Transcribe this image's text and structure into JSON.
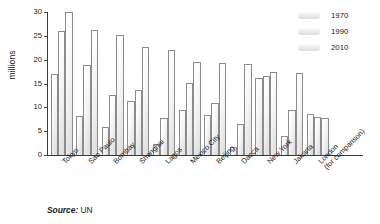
{
  "chart_data": {
    "type": "bar",
    "title": "",
    "xlabel": "",
    "ylabel": "millions",
    "ylim": [
      0,
      30
    ],
    "yticks": [
      0,
      5,
      10,
      15,
      20,
      25,
      30
    ],
    "grid": false,
    "legend_position": "top-right",
    "categories": [
      "Tokyo",
      "Sao Paulo",
      "Bombay",
      "Shanghai",
      "Lagos",
      "Mexico City",
      "Beijing",
      "Dacca",
      "New York",
      "Jakarta",
      "London"
    ],
    "category_sublabels": [
      "",
      "",
      "",
      "",
      "",
      "",
      "",
      "",
      "",
      "",
      "(for comparison)"
    ],
    "series": [
      {
        "name": "1970",
        "values": [
          17.0,
          8.1,
          5.8,
          11.4,
          2.3,
          9.5,
          8.4,
          1.7,
          16.2,
          4.0,
          8.6
        ]
      },
      {
        "name": "1990",
        "values": [
          26.0,
          18.8,
          12.6,
          13.6,
          7.7,
          15.1,
          10.9,
          6.6,
          16.6,
          9.4,
          8.0
        ]
      },
      {
        "name": "2010",
        "values": [
          30.0,
          26.2,
          25.2,
          22.6,
          22.0,
          19.6,
          19.4,
          19.0,
          17.5,
          17.3,
          7.8
        ]
      }
    ],
    "colors": {
      "bar_fill_light": "#ffffff",
      "bar_fill_dark": "#dcdcdc",
      "bar_border": "#8c8c8c",
      "axis": "#3a3a3a",
      "text": "#1a1a1a"
    }
  },
  "legend": {
    "items": [
      {
        "label": "1970"
      },
      {
        "label": "1990"
      },
      {
        "label": "2010"
      }
    ]
  },
  "source": {
    "label": "Source:",
    "value": " UN"
  }
}
